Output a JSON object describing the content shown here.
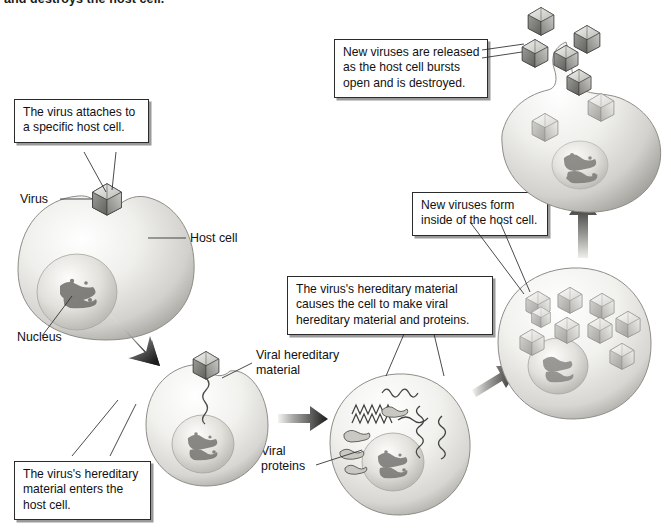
{
  "figure": {
    "top_caption": "and destroys the host cell."
  },
  "callouts": [
    {
      "id": "attach",
      "name": "callout-virus-attaches",
      "lines": [
        "The virus attaches to",
        "a specific host cell."
      ]
    },
    {
      "id": "enters",
      "name": "callout-material-enters",
      "lines": [
        "The virus's hereditary",
        "material enters the",
        "host cell."
      ]
    },
    {
      "id": "makes",
      "name": "callout-cell-makes-viral-parts",
      "lines": [
        "The virus's hereditary material",
        "causes the cell to make viral",
        "hereditary material and proteins."
      ]
    },
    {
      "id": "form",
      "name": "callout-new-viruses-form",
      "lines": [
        "New viruses form",
        "inside of the host cell."
      ]
    },
    {
      "id": "released",
      "name": "callout-new-viruses-released",
      "lines": [
        "New viruses are released",
        "as the host cell bursts",
        "open and is destroyed."
      ]
    }
  ],
  "labels": [
    {
      "id": "virus",
      "name": "label-virus",
      "lines": [
        "Virus"
      ]
    },
    {
      "id": "hostcell",
      "name": "label-host-cell",
      "lines": [
        "Host cell"
      ]
    },
    {
      "id": "nucleus",
      "name": "label-nucleus",
      "lines": [
        "Nucleus"
      ]
    },
    {
      "id": "vhm",
      "name": "label-viral-hereditary-material",
      "lines": [
        "Viral hereditary",
        "material"
      ]
    },
    {
      "id": "vprot",
      "name": "label-viral-proteins",
      "lines": [
        "Viral",
        "proteins"
      ]
    }
  ],
  "stages": [
    {
      "id": "stage-1",
      "name": "cell-stage-attachment",
      "virus_count": 1
    },
    {
      "id": "stage-2",
      "name": "cell-stage-entry",
      "virus_count": 1
    },
    {
      "id": "stage-3",
      "name": "cell-stage-replication",
      "virus_count": 0
    },
    {
      "id": "stage-4",
      "name": "cell-stage-assembly",
      "virus_count": 9
    },
    {
      "id": "stage-5",
      "name": "cell-stage-lysis",
      "virus_count": 7
    }
  ],
  "colors": {
    "cell_light": "#fbfbfa",
    "cell_mid": "#d6d5d2",
    "cell_dark": "#9a9994",
    "nucleus_mid": "#cfcec9",
    "virus_light": "#e9e9e6",
    "virus_dark": "#6f6f6c",
    "outline": "#2b2b2b",
    "shadow": "#9a9a9a",
    "text": "#111111"
  }
}
